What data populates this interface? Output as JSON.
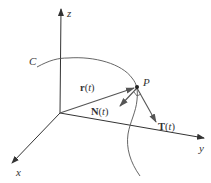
{
  "figure": {
    "colors": {
      "background": "#ffffff",
      "axis": "#333333",
      "curve": "#555555",
      "vector": "#555555",
      "text": "#333333"
    },
    "axes": {
      "x": {
        "label": "x"
      },
      "y": {
        "label": "y"
      },
      "z": {
        "label": "z"
      }
    },
    "curve": {
      "label": "C"
    },
    "point": {
      "label": "P"
    },
    "vectors": {
      "position": {
        "name": "r",
        "arg": "(t)",
        "open": "(",
        "var": "t",
        "close": ")"
      },
      "normal": {
        "name": "N",
        "open": "(",
        "var": "t",
        "close": ")"
      },
      "tangent": {
        "name": "T",
        "open": "(",
        "var": "t",
        "close": ")"
      }
    },
    "annotations": {
      "right_angle_marker": "right angle between N(t) and T(t) at P"
    }
  }
}
